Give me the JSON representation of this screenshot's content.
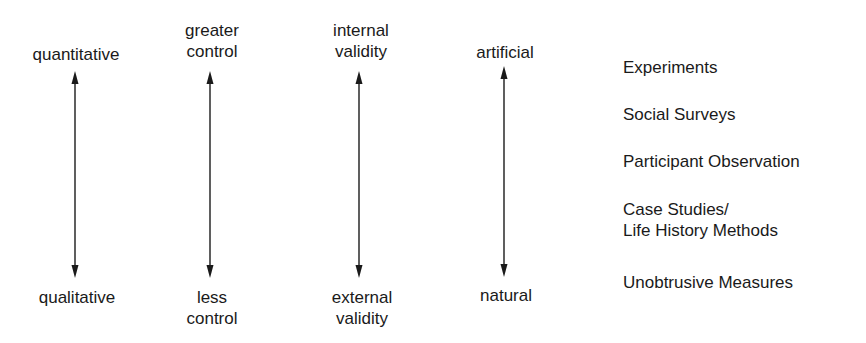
{
  "diagram": {
    "dimensions": [
      {
        "id": "data-type",
        "top": [
          "quantitative"
        ],
        "bottom": [
          "qualitative"
        ],
        "x": 75
      },
      {
        "id": "control",
        "top": [
          "greater",
          "control"
        ],
        "bottom": [
          "less",
          "control"
        ],
        "x": 210
      },
      {
        "id": "validity",
        "top": [
          "internal",
          "validity"
        ],
        "bottom": [
          "external",
          "validity"
        ],
        "x": 359
      },
      {
        "id": "setting",
        "top": [
          "artificial"
        ],
        "bottom": [
          "natural"
        ],
        "x": 504
      }
    ],
    "methods": [
      {
        "lines": [
          "Experiments"
        ]
      },
      {
        "lines": [
          "Social Surveys"
        ]
      },
      {
        "lines": [
          "Participant Observation"
        ]
      },
      {
        "lines": [
          "Case Studies/",
          "Life History Methods"
        ]
      },
      {
        "lines": [
          "Unobtrusive Measures"
        ]
      }
    ],
    "arrow_style": {
      "color": "#1a1a1a",
      "type": "double-headed-vertical"
    }
  }
}
